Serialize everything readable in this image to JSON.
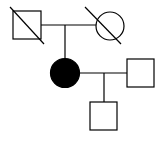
{
  "diagram": {
    "type": "pedigree",
    "colors": {
      "stroke": "#000000",
      "fill_affected": "#000000",
      "background": "#ffffff"
    },
    "individuals": [
      {
        "id": "grandfather",
        "sex": "male",
        "affected": false,
        "deceased": true
      },
      {
        "id": "grandmother",
        "sex": "female",
        "affected": false,
        "deceased": true
      },
      {
        "id": "proband-mother",
        "sex": "female",
        "affected": true,
        "deceased": false
      },
      {
        "id": "partner",
        "sex": "male",
        "affected": false,
        "deceased": false
      },
      {
        "id": "son",
        "sex": "male",
        "affected": false,
        "deceased": false
      }
    ],
    "relationships": [
      {
        "type": "mating",
        "members": [
          "grandfather",
          "grandmother"
        ],
        "children": [
          "proband-mother"
        ]
      },
      {
        "type": "mating",
        "members": [
          "proband-mother",
          "partner"
        ],
        "children": [
          "son"
        ]
      }
    ]
  }
}
